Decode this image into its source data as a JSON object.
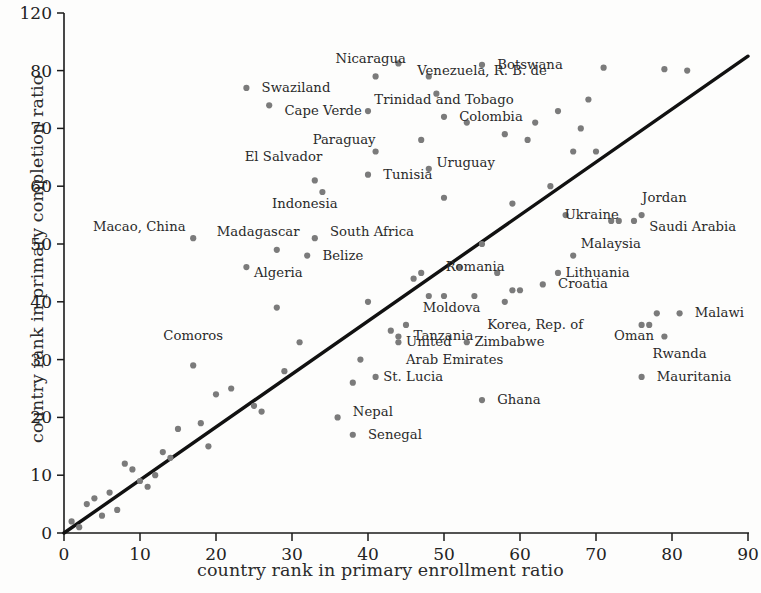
{
  "chart_data": {
    "type": "scatter",
    "title": "",
    "xlabel": "country rank in primary enrollment ratio",
    "ylabel": "country rank in primary completion ratio",
    "xlim": [
      0,
      90
    ],
    "ylim": [
      0,
      120
    ],
    "grid": false,
    "legend": null,
    "xticks": [
      0,
      10,
      20,
      30,
      40,
      50,
      60,
      70,
      80,
      90
    ],
    "xtick_labels": [
      "0",
      "10",
      "20",
      "30",
      "40",
      "50",
      "60",
      "70",
      "80",
      "90"
    ],
    "yticks": [
      0,
      10,
      20,
      30,
      40,
      50,
      60,
      70,
      80,
      120
    ],
    "ytick_labels": [
      "0",
      "10",
      "20",
      "30",
      "40",
      "50",
      "60",
      "70",
      "80",
      "120"
    ],
    "reference_line": {
      "description": "45-degree identity line",
      "x": [
        0,
        90
      ],
      "y": [
        0,
        90
      ]
    },
    "marker_color": "#7b7b7b",
    "line_color": "#111111",
    "labeled_points": [
      {
        "label": "Nicaragua",
        "x": 44,
        "y": 85,
        "anchor": "end",
        "label_x": 45,
        "label_y": 88
      },
      {
        "label": "Botswana",
        "x": 55,
        "y": 84,
        "anchor": "start",
        "label_x": 57,
        "label_y": 84
      },
      {
        "label": "Venezuela, R. B. de",
        "x": 48,
        "y": 79,
        "anchor": "mid",
        "label_x": 55,
        "label_y": 80
      },
      {
        "label": "Swaziland",
        "x": 24,
        "y": 77,
        "anchor": "start",
        "label_x": 26,
        "label_y": 77
      },
      {
        "label": "Cape Verde",
        "x": 27,
        "y": 74,
        "anchor": "start",
        "label_x": 29,
        "label_y": 73
      },
      {
        "label": "Trinidad and Tobago",
        "x": 40,
        "y": 73,
        "anchor": "mid",
        "label_x": 50,
        "label_y": 75
      },
      {
        "label": "Colombia",
        "x": 50,
        "y": 72,
        "anchor": "start",
        "label_x": 52,
        "label_y": 72
      },
      {
        "label": "Paraguay",
        "x": 41,
        "y": 66,
        "anchor": "end",
        "label_x": 41,
        "label_y": 68
      },
      {
        "label": "El Salvador",
        "x": 33,
        "y": 61,
        "anchor": "end",
        "label_x": 34,
        "label_y": 65
      },
      {
        "label": "Uruguay",
        "x": 48,
        "y": 63,
        "anchor": "start",
        "label_x": 49,
        "label_y": 64
      },
      {
        "label": "Tunisia",
        "x": 40,
        "y": 62,
        "anchor": "start",
        "label_x": 42,
        "label_y": 62
      },
      {
        "label": "Indonesia",
        "x": 34,
        "y": 59,
        "anchor": "end",
        "label_x": 36,
        "label_y": 57
      },
      {
        "label": "Jordan",
        "x": 76,
        "y": 55,
        "anchor": "mid",
        "label_x": 79,
        "label_y": 58
      },
      {
        "label": "Ukraine",
        "x": 73,
        "y": 54,
        "anchor": "end",
        "label_x": 73,
        "label_y": 55
      },
      {
        "label": "Saudi Arabia",
        "x": 75,
        "y": 54,
        "anchor": "start",
        "label_x": 77,
        "label_y": 53
      },
      {
        "label": "Macao, China",
        "x": 17,
        "y": 51,
        "anchor": "end",
        "label_x": 16,
        "label_y": 53
      },
      {
        "label": "Madagascar",
        "x": 28,
        "y": 49,
        "anchor": "end",
        "label_x": 31,
        "label_y": 52
      },
      {
        "label": "South Africa",
        "x": 33,
        "y": 51,
        "anchor": "start",
        "label_x": 35,
        "label_y": 52
      },
      {
        "label": "Malaysia",
        "x": 67,
        "y": 48,
        "anchor": "start",
        "label_x": 68,
        "label_y": 50
      },
      {
        "label": "Belize",
        "x": 32,
        "y": 48,
        "anchor": "start",
        "label_x": 34,
        "label_y": 48
      },
      {
        "label": "Algeria",
        "x": 24,
        "y": 46,
        "anchor": "start",
        "label_x": 25,
        "label_y": 45
      },
      {
        "label": "Romania",
        "x": 57,
        "y": 45,
        "anchor": "end",
        "label_x": 58,
        "label_y": 46
      },
      {
        "label": "Lithuania",
        "x": 65,
        "y": 45,
        "anchor": "start",
        "label_x": 66,
        "label_y": 45
      },
      {
        "label": "Croatia",
        "x": 63,
        "y": 43,
        "anchor": "start",
        "label_x": 65,
        "label_y": 43
      },
      {
        "label": "Malawi",
        "x": 81,
        "y": 38,
        "anchor": "start",
        "label_x": 83,
        "label_y": 38
      },
      {
        "label": "Moldova",
        "x": 50,
        "y": 41,
        "anchor": "mid",
        "label_x": 51,
        "label_y": 39
      },
      {
        "label": "Korea, Rep. of",
        "x": 58,
        "y": 40,
        "anchor": "mid",
        "label_x": 62,
        "label_y": 36
      },
      {
        "label": "Oman",
        "x": 77,
        "y": 36,
        "anchor": "mid",
        "label_x": 75,
        "label_y": 34
      },
      {
        "label": "Tanzania",
        "x": 45,
        "y": 36,
        "anchor": "start",
        "label_x": 46,
        "label_y": 34
      },
      {
        "label": "Comoros",
        "x": 17,
        "y": 29,
        "anchor": "mid",
        "label_x": 17,
        "label_y": 34
      },
      {
        "label": "Rwanda",
        "x": 79,
        "y": 34,
        "anchor": "mid",
        "label_x": 81,
        "label_y": 31
      },
      {
        "label": "Zimbabwe",
        "x": 53,
        "y": 33,
        "anchor": "start",
        "label_x": 54,
        "label_y": 33
      },
      {
        "label": "United",
        "x": 44,
        "y": 33,
        "anchor": "start",
        "label_x": 45,
        "label_y": 33
      },
      {
        "label": "Arab Emirates",
        "x": 44,
        "y": 33,
        "anchor": "start",
        "label_x": 45,
        "label_y": 30
      },
      {
        "label": "Mauritania",
        "x": 76,
        "y": 27,
        "anchor": "start",
        "label_x": 78,
        "label_y": 27
      },
      {
        "label": "St. Lucia",
        "x": 41,
        "y": 27,
        "anchor": "start",
        "label_x": 42,
        "label_y": 27
      },
      {
        "label": "Ghana",
        "x": 55,
        "y": 23,
        "anchor": "start",
        "label_x": 57,
        "label_y": 23
      },
      {
        "label": "Nepal",
        "x": 36,
        "y": 20,
        "anchor": "start",
        "label_x": 38,
        "label_y": 21
      },
      {
        "label": "Senegal",
        "x": 38,
        "y": 17,
        "anchor": "start",
        "label_x": 40,
        "label_y": 17
      }
    ],
    "points": [
      {
        "x": 1,
        "y": 2
      },
      {
        "x": 2,
        "y": 1
      },
      {
        "x": 3,
        "y": 5
      },
      {
        "x": 4,
        "y": 6
      },
      {
        "x": 4,
        "y": 6
      },
      {
        "x": 5,
        "y": 3
      },
      {
        "x": 6,
        "y": 7
      },
      {
        "x": 7,
        "y": 4
      },
      {
        "x": 8,
        "y": 12
      },
      {
        "x": 9,
        "y": 11
      },
      {
        "x": 10,
        "y": 9
      },
      {
        "x": 11,
        "y": 8
      },
      {
        "x": 12,
        "y": 10
      },
      {
        "x": 13,
        "y": 14
      },
      {
        "x": 14,
        "y": 13
      },
      {
        "x": 15,
        "y": 18
      },
      {
        "x": 17,
        "y": 29
      },
      {
        "x": 18,
        "y": 19
      },
      {
        "x": 19,
        "y": 15
      },
      {
        "x": 20,
        "y": 24
      },
      {
        "x": 22,
        "y": 25
      },
      {
        "x": 25,
        "y": 22
      },
      {
        "x": 26,
        "y": 21
      },
      {
        "x": 28,
        "y": 39
      },
      {
        "x": 29,
        "y": 28
      },
      {
        "x": 31,
        "y": 33
      },
      {
        "x": 17,
        "y": 51
      },
      {
        "x": 24,
        "y": 46
      },
      {
        "x": 24,
        "y": 77
      },
      {
        "x": 27,
        "y": 74
      },
      {
        "x": 28,
        "y": 49
      },
      {
        "x": 32,
        "y": 48
      },
      {
        "x": 33,
        "y": 51
      },
      {
        "x": 33,
        "y": 61
      },
      {
        "x": 34,
        "y": 59
      },
      {
        "x": 36,
        "y": 20
      },
      {
        "x": 38,
        "y": 17
      },
      {
        "x": 38,
        "y": 26
      },
      {
        "x": 39,
        "y": 30
      },
      {
        "x": 40,
        "y": 40
      },
      {
        "x": 40,
        "y": 62
      },
      {
        "x": 40,
        "y": 73
      },
      {
        "x": 41,
        "y": 27
      },
      {
        "x": 41,
        "y": 66
      },
      {
        "x": 41,
        "y": 79
      },
      {
        "x": 43,
        "y": 35
      },
      {
        "x": 44,
        "y": 33
      },
      {
        "x": 44,
        "y": 34
      },
      {
        "x": 44,
        "y": 85
      },
      {
        "x": 45,
        "y": 36
      },
      {
        "x": 46,
        "y": 44
      },
      {
        "x": 47,
        "y": 45
      },
      {
        "x": 47,
        "y": 68
      },
      {
        "x": 48,
        "y": 63
      },
      {
        "x": 48,
        "y": 79
      },
      {
        "x": 48,
        "y": 41
      },
      {
        "x": 49,
        "y": 76
      },
      {
        "x": 50,
        "y": 41
      },
      {
        "x": 50,
        "y": 58
      },
      {
        "x": 50,
        "y": 72
      },
      {
        "x": 52,
        "y": 46
      },
      {
        "x": 53,
        "y": 33
      },
      {
        "x": 53,
        "y": 71
      },
      {
        "x": 54,
        "y": 41
      },
      {
        "x": 55,
        "y": 23
      },
      {
        "x": 55,
        "y": 50
      },
      {
        "x": 55,
        "y": 84
      },
      {
        "x": 57,
        "y": 45
      },
      {
        "x": 58,
        "y": 40
      },
      {
        "x": 58,
        "y": 69
      },
      {
        "x": 59,
        "y": 42
      },
      {
        "x": 59,
        "y": 57
      },
      {
        "x": 60,
        "y": 42
      },
      {
        "x": 61,
        "y": 68
      },
      {
        "x": 62,
        "y": 71
      },
      {
        "x": 63,
        "y": 43
      },
      {
        "x": 64,
        "y": 60
      },
      {
        "x": 65,
        "y": 45
      },
      {
        "x": 65,
        "y": 73
      },
      {
        "x": 66,
        "y": 55
      },
      {
        "x": 67,
        "y": 48
      },
      {
        "x": 67,
        "y": 66
      },
      {
        "x": 68,
        "y": 70
      },
      {
        "x": 69,
        "y": 75
      },
      {
        "x": 70,
        "y": 66
      },
      {
        "x": 71,
        "y": 82
      },
      {
        "x": 72,
        "y": 54
      },
      {
        "x": 73,
        "y": 54
      },
      {
        "x": 75,
        "y": 54
      },
      {
        "x": 76,
        "y": 27
      },
      {
        "x": 76,
        "y": 36
      },
      {
        "x": 76,
        "y": 55
      },
      {
        "x": 77,
        "y": 36
      },
      {
        "x": 78,
        "y": 38
      },
      {
        "x": 79,
        "y": 34
      },
      {
        "x": 79,
        "y": 81
      },
      {
        "x": 81,
        "y": 38
      },
      {
        "x": 82,
        "y": 80
      }
    ]
  }
}
